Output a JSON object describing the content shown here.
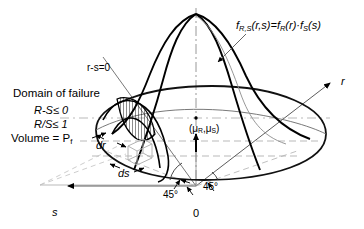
{
  "figure": {
    "kind": "3d-joint-density-reliability-diagram"
  },
  "annotations": {
    "domain_title": "Domain of failure",
    "condition_1": "R-S≤ 0",
    "condition_2": "R/S≤ 1",
    "volume": "Volume = P",
    "volume_sub": "f",
    "limit_state": "r-s=0",
    "dr": "dr",
    "ds": "ds",
    "mean_point": "(μ",
    "mean_point_sub1": "R",
    "mean_point_mid": ",μ",
    "mean_point_sub2": "S",
    "mean_point_end": ")",
    "angle_left": "45°",
    "angle_right": "45°",
    "origin": "0"
  },
  "density_formula": {
    "f": "f",
    "f_sub": "R,S",
    "args": "(r,s)=",
    "f2": "f",
    "f2_sub": "R",
    "args2": "(r)·",
    "f3": "f",
    "f3_sub": "S",
    "args3": "(s)"
  },
  "axes": {
    "r_label": "r",
    "s_label": "s",
    "vertical_label": ""
  },
  "colors": {
    "stroke": "#000000",
    "grid": "#9a9a9a",
    "thin": "#6e6e6e",
    "background": "#ffffff"
  }
}
